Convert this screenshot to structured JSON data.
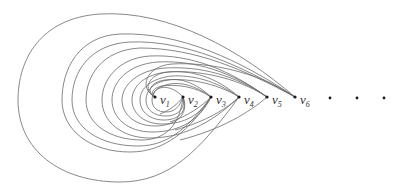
{
  "diagram": {
    "type": "graph-drawing",
    "vertices": [
      {
        "id": "v1",
        "label": "v",
        "sub": "1",
        "x": 155,
        "y": 97
      },
      {
        "id": "v2",
        "label": "v",
        "sub": "2",
        "x": 183,
        "y": 97
      },
      {
        "id": "v3",
        "label": "v",
        "sub": "3",
        "x": 211,
        "y": 97
      },
      {
        "id": "v4",
        "label": "v",
        "sub": "4",
        "x": 239,
        "y": 97
      },
      {
        "id": "v5",
        "label": "v",
        "sub": "5",
        "x": 267,
        "y": 97
      },
      {
        "id": "v6",
        "label": "v",
        "sub": "6",
        "x": 295,
        "y": 97
      }
    ],
    "ellipsis_dots": [
      {
        "x": 330,
        "y": 98
      },
      {
        "x": 357,
        "y": 98
      },
      {
        "x": 384,
        "y": 98
      }
    ],
    "edge_color": "#6a6a6a",
    "vertex_color": "#1a1a1a"
  }
}
